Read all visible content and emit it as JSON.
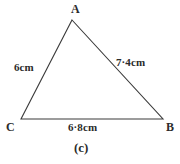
{
  "figure": {
    "caption": "(c)",
    "shape_type": "triangle",
    "stroke_color": "#3a3a3a",
    "text_color": "#2b2b2b",
    "background_color": "#ffffff"
  },
  "vertices": [
    {
      "name": "A",
      "label": "A",
      "x": 72,
      "y": 20
    },
    {
      "name": "B",
      "label": "B",
      "x": 163,
      "y": 119
    },
    {
      "name": "C",
      "label": "C",
      "x": 21,
      "y": 119
    }
  ],
  "sides": [
    {
      "name": "CA",
      "label": "6cm",
      "from": "C",
      "to": "A"
    },
    {
      "name": "AB",
      "label": "7·4cm",
      "from": "A",
      "to": "B"
    },
    {
      "name": "CB",
      "label": "6·8cm",
      "from": "C",
      "to": "B"
    }
  ]
}
